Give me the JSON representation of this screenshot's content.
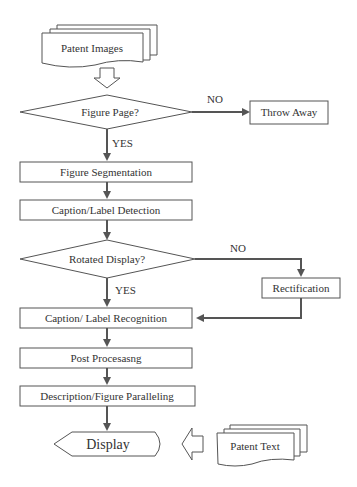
{
  "diagram": {
    "type": "flowchart",
    "nodes": {
      "patent_images": "Patent Images",
      "figure_page": "Figure Page?",
      "throw_away": "Throw Away",
      "figure_segmentation": "Figure Segmentation",
      "caption_detection": "Caption/Label Detection",
      "rotated_display": "Rotated Display?",
      "rectification": "Rectification",
      "caption_recognition": "Caption/ Label Recognition",
      "post_processing": "Post Procesasng",
      "description_paralleling": "Description/Figure Paralleling",
      "display": "Display",
      "patent_text": "Patent Text"
    },
    "edge_labels": {
      "figure_page_no": "NO",
      "figure_page_yes": "YES",
      "rotated_no": "NO",
      "rotated_yes": "YES"
    }
  }
}
